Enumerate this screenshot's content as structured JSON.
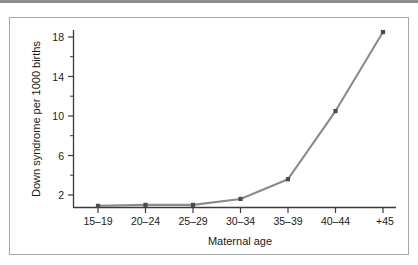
{
  "figure": {
    "background_color": "#ffffff",
    "border_color": "#a8a8a8",
    "rule_color": "#8e8e8e"
  },
  "chart_data": {
    "type": "line",
    "title": "",
    "xlabel": "Maternal age",
    "ylabel": "Down syndrome per 1000 births",
    "categories": [
      "15–19",
      "20–24",
      "25–29",
      "30–34",
      "35–39",
      "40–44",
      "+45"
    ],
    "values": [
      0.9,
      1.0,
      1.0,
      1.6,
      3.6,
      10.5,
      18.5
    ],
    "ytick_labels": [
      "2",
      "6",
      "10",
      "14",
      "18"
    ],
    "ytick_values": [
      2,
      6,
      10,
      14,
      18
    ],
    "yminor_values": [
      4,
      8,
      12,
      16
    ],
    "ylim": [
      0,
      19.5
    ],
    "grid": false,
    "legend": null,
    "line_color": "#8b8b8b",
    "marker_color": "#4a4a52",
    "axis_color": "#3b3b3b"
  }
}
